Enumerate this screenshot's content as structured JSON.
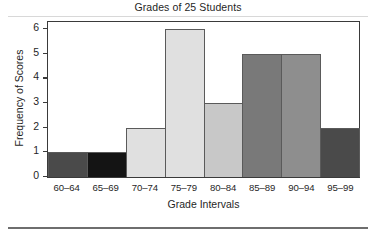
{
  "chart_data": {
    "type": "bar",
    "title": "Grades of 25 Students",
    "xlabel": "Grade Intervals",
    "ylabel": "Frequency of Scores",
    "categories": [
      "60–64",
      "65–69",
      "70–74",
      "75–79",
      "80–84",
      "85–89",
      "90–94",
      "95–99"
    ],
    "values": [
      1,
      1,
      2,
      6,
      3,
      5,
      5,
      2
    ],
    "bar_colors": [
      "#4a4a4a",
      "#141414",
      "#e0e0e0",
      "#e0e0e0",
      "#c8c8c8",
      "#797979",
      "#8e8e8e",
      "#4a4a4a"
    ],
    "ytick_labels": [
      "0",
      "1",
      "2",
      "3",
      "4",
      "5",
      "6"
    ],
    "ytick_values": [
      0,
      1,
      2,
      3,
      4,
      5,
      6
    ],
    "ylim": [
      0,
      6.3
    ],
    "grid": false,
    "legend": "none",
    "axis_color": "#3a3a3a",
    "bar_edge_color": "#5a5a5a",
    "background": "#ffffff"
  }
}
